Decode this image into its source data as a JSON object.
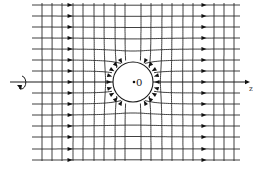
{
  "figure": {
    "type": "field-line diagram",
    "colors": {
      "line": "#2a2a2a",
      "background": "#ffffff",
      "arrow": "#111111"
    }
  },
  "sphere": {
    "center_label": "0",
    "cx": 133,
    "cy": 82,
    "r": 20
  },
  "axis": {
    "label": "z",
    "x_start": 10,
    "x_end": 250,
    "y": 82,
    "rotation_symbol": "circular-arrow"
  },
  "field_lines": {
    "x_start": 32,
    "x_end": 240,
    "y_positions": [
      5,
      16,
      27,
      38,
      49,
      60,
      71,
      82,
      93,
      104,
      115,
      126,
      137,
      149,
      160
    ],
    "arrow_columns": [
      70,
      204
    ],
    "direction": "left-to-right"
  },
  "equipotential_lines": {
    "y_start": 3,
    "y_end": 162,
    "x_positions": [
      42,
      52,
      62,
      73,
      83,
      94,
      104,
      115,
      125,
      141,
      151,
      162,
      172,
      183,
      193,
      214,
      224,
      234
    ]
  },
  "near_sphere_arrows": {
    "count": 16,
    "description": "Arrowheads on field lines just outside the sphere surface"
  }
}
